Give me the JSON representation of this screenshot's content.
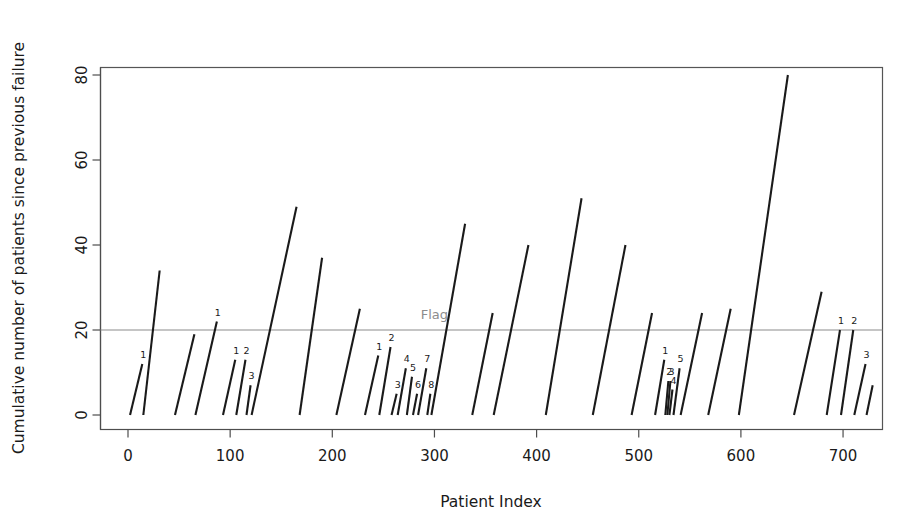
{
  "chart_data": {
    "type": "line",
    "title": "",
    "xlabel": "Patient Index",
    "ylabel": "Cumulative number of patients since previous failure",
    "xlim": [
      -25,
      740
    ],
    "ylim": [
      -3,
      82
    ],
    "xticks": [
      0,
      100,
      200,
      300,
      400,
      500,
      600,
      700
    ],
    "xtick_labels": [
      "0",
      "100",
      "200",
      "300",
      "400",
      "500",
      "600",
      "700"
    ],
    "yticks": [
      0,
      20,
      40,
      60,
      80
    ],
    "ytick_labels": [
      "0",
      "20",
      "40",
      "60",
      "80"
    ],
    "grid": false,
    "legend": null,
    "annotations": [
      {
        "name": "flag-threshold",
        "label": "Flag",
        "y": 20,
        "label_x": 300,
        "label_y": 22.5,
        "color": "#8c8c8c",
        "type": "hline"
      }
    ],
    "series": [
      {
        "name": "cumulative-patients-since-previous-failure",
        "color": "#1a1a1a",
        "segments": [
          {
            "x_start": 2,
            "x_end": 14,
            "y_start": 0,
            "y_end": 12,
            "label": "1"
          },
          {
            "x_start": 15,
            "x_end": 31,
            "y_start": 0,
            "y_end": 34,
            "label": ""
          },
          {
            "x_start": 46,
            "x_end": 65,
            "y_start": 0,
            "y_end": 19,
            "label": ""
          },
          {
            "x_start": 66,
            "x_end": 87,
            "y_start": 0,
            "y_end": 22,
            "label": "1"
          },
          {
            "x_start": 93,
            "x_end": 105,
            "y_start": 0,
            "y_end": 13,
            "label": "1"
          },
          {
            "x_start": 106,
            "x_end": 115,
            "y_start": 0,
            "y_end": 13,
            "label": "2"
          },
          {
            "x_start": 116,
            "x_end": 120,
            "y_start": 0,
            "y_end": 7,
            "label": "3"
          },
          {
            "x_start": 121,
            "x_end": 165,
            "y_start": 0,
            "y_end": 49,
            "label": ""
          },
          {
            "x_start": 168,
            "x_end": 190,
            "y_start": 0,
            "y_end": 37,
            "label": ""
          },
          {
            "x_start": 204,
            "x_end": 227,
            "y_start": 0,
            "y_end": 25,
            "label": ""
          },
          {
            "x_start": 232,
            "x_end": 245,
            "y_start": 0,
            "y_end": 14,
            "label": "1"
          },
          {
            "x_start": 246,
            "x_end": 257,
            "y_start": 0,
            "y_end": 16,
            "label": "2"
          },
          {
            "x_start": 258,
            "x_end": 263,
            "y_start": 0,
            "y_end": 5,
            "label": "3"
          },
          {
            "x_start": 264,
            "x_end": 272,
            "y_start": 0,
            "y_end": 11,
            "label": "4"
          },
          {
            "x_start": 273,
            "x_end": 278,
            "y_start": 0,
            "y_end": 9,
            "label": "5"
          },
          {
            "x_start": 279,
            "x_end": 283,
            "y_start": 0,
            "y_end": 5,
            "label": "6"
          },
          {
            "x_start": 284,
            "x_end": 292,
            "y_start": 0,
            "y_end": 11,
            "label": "7"
          },
          {
            "x_start": 293,
            "x_end": 296,
            "y_start": 0,
            "y_end": 5,
            "label": "8"
          },
          {
            "x_start": 297,
            "x_end": 330,
            "y_start": 0,
            "y_end": 45,
            "label": ""
          },
          {
            "x_start": 337,
            "x_end": 357,
            "y_start": 0,
            "y_end": 24,
            "label": ""
          },
          {
            "x_start": 358,
            "x_end": 392,
            "y_start": 0,
            "y_end": 40,
            "label": ""
          },
          {
            "x_start": 409,
            "x_end": 444,
            "y_start": 0,
            "y_end": 51,
            "label": ""
          },
          {
            "x_start": 455,
            "x_end": 487,
            "y_start": 0,
            "y_end": 40,
            "label": ""
          },
          {
            "x_start": 493,
            "x_end": 513,
            "y_start": 0,
            "y_end": 24,
            "label": ""
          },
          {
            "x_start": 516,
            "x_end": 525,
            "y_start": 0,
            "y_end": 13,
            "label": "1"
          },
          {
            "x_start": 526,
            "x_end": 529,
            "y_start": 0,
            "y_end": 8,
            "label": "2"
          },
          {
            "x_start": 528,
            "x_end": 531,
            "y_start": 0,
            "y_end": 8,
            "label": "3"
          },
          {
            "x_start": 530,
            "x_end": 533,
            "y_start": 0,
            "y_end": 6,
            "label": "4"
          },
          {
            "x_start": 534,
            "x_end": 540,
            "y_start": 0,
            "y_end": 11,
            "label": "5"
          },
          {
            "x_start": 541,
            "x_end": 562,
            "y_start": 0,
            "y_end": 24,
            "label": ""
          },
          {
            "x_start": 568,
            "x_end": 590,
            "y_start": 0,
            "y_end": 25,
            "label": ""
          },
          {
            "x_start": 598,
            "x_end": 646,
            "y_start": 0,
            "y_end": 80,
            "label": ""
          },
          {
            "x_start": 652,
            "x_end": 679,
            "y_start": 0,
            "y_end": 29,
            "label": ""
          },
          {
            "x_start": 684,
            "x_end": 697,
            "y_start": 0,
            "y_end": 20,
            "label": "1"
          },
          {
            "x_start": 698,
            "x_end": 710,
            "y_start": 0,
            "y_end": 20,
            "label": "2"
          },
          {
            "x_start": 711,
            "x_end": 722,
            "y_start": 0,
            "y_end": 12,
            "label": "3"
          },
          {
            "x_start": 723,
            "x_end": 729,
            "y_start": 0,
            "y_end": 7,
            "label": ""
          }
        ]
      }
    ]
  }
}
